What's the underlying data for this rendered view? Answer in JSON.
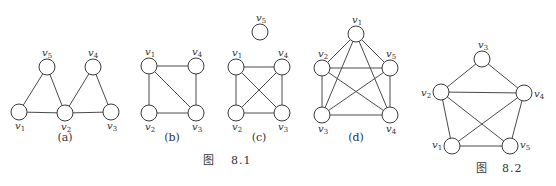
{
  "figures": [
    {
      "id": "8.1a",
      "caption": "(a)",
      "caption_pos": [
        65,
        141
      ],
      "nodes": [
        {
          "name": "v1",
          "x": 19,
          "y": 112,
          "label_dx": -4,
          "label_dy": 17
        },
        {
          "name": "v2",
          "x": 65,
          "y": 113,
          "label_dx": -4,
          "label_dy": 17
        },
        {
          "name": "v3",
          "x": 111,
          "y": 112,
          "label_dx": -4,
          "label_dy": 17
        },
        {
          "name": "v4",
          "x": 93,
          "y": 67,
          "label_dx": -5,
          "label_dy": -11
        },
        {
          "name": "v5",
          "x": 47,
          "y": 67,
          "label_dx": -5,
          "label_dy": -11
        }
      ],
      "edges": [
        [
          "v1",
          "v5"
        ],
        [
          "v5",
          "v2"
        ],
        [
          "v1",
          "v2"
        ],
        [
          "v2",
          "v4"
        ],
        [
          "v4",
          "v3"
        ],
        [
          "v2",
          "v3"
        ]
      ]
    },
    {
      "id": "8.1b",
      "caption": "(b)",
      "caption_pos": [
        172,
        141
      ],
      "nodes": [
        {
          "name": "v1",
          "x": 149,
          "y": 66,
          "label_dx": -4,
          "label_dy": -11
        },
        {
          "name": "v4",
          "x": 196,
          "y": 66,
          "label_dx": -4,
          "label_dy": -11
        },
        {
          "name": "v2",
          "x": 149,
          "y": 113,
          "label_dx": -4,
          "label_dy": 17
        },
        {
          "name": "v3",
          "x": 196,
          "y": 113,
          "label_dx": -4,
          "label_dy": 17
        }
      ],
      "edges": [
        [
          "v1",
          "v4"
        ],
        [
          "v1",
          "v2"
        ],
        [
          "v1",
          "v3"
        ],
        [
          "v4",
          "v3"
        ],
        [
          "v2",
          "v3"
        ]
      ]
    },
    {
      "id": "8.1c",
      "caption": "(c)",
      "caption_pos": [
        259,
        141
      ],
      "nodes": [
        {
          "name": "v5",
          "x": 260,
          "y": 32,
          "label_dx": -4,
          "label_dy": -11
        },
        {
          "name": "v1",
          "x": 236,
          "y": 67,
          "label_dx": -4,
          "label_dy": -11
        },
        {
          "name": "v4",
          "x": 282,
          "y": 67,
          "label_dx": -4,
          "label_dy": -11
        },
        {
          "name": "v2",
          "x": 236,
          "y": 113,
          "label_dx": -4,
          "label_dy": 17
        },
        {
          "name": "v3",
          "x": 282,
          "y": 113,
          "label_dx": -4,
          "label_dy": 17
        }
      ],
      "edges": [
        [
          "v1",
          "v4"
        ],
        [
          "v1",
          "v2"
        ],
        [
          "v1",
          "v3"
        ],
        [
          "v4",
          "v2"
        ],
        [
          "v4",
          "v3"
        ],
        [
          "v2",
          "v3"
        ]
      ]
    },
    {
      "id": "8.1d",
      "caption": "(d)",
      "caption_pos": [
        356,
        141
      ],
      "nodes": [
        {
          "name": "v1",
          "x": 356,
          "y": 34,
          "label_dx": -4,
          "label_dy": -11
        },
        {
          "name": "v2",
          "x": 322,
          "y": 68,
          "label_dx": -4,
          "label_dy": -11
        },
        {
          "name": "v5",
          "x": 390,
          "y": 68,
          "label_dx": -4,
          "label_dy": -11
        },
        {
          "name": "v3",
          "x": 322,
          "y": 115,
          "label_dx": -4,
          "label_dy": 17
        },
        {
          "name": "v4",
          "x": 390,
          "y": 115,
          "label_dx": -4,
          "label_dy": 17
        }
      ],
      "edges": [
        [
          "v1",
          "v2"
        ],
        [
          "v1",
          "v5"
        ],
        [
          "v1",
          "v3"
        ],
        [
          "v1",
          "v4"
        ],
        [
          "v2",
          "v5"
        ],
        [
          "v2",
          "v3"
        ],
        [
          "v2",
          "v4"
        ],
        [
          "v5",
          "v3"
        ],
        [
          "v5",
          "v4"
        ],
        [
          "v3",
          "v4"
        ]
      ]
    },
    {
      "id": "8.2",
      "caption": "",
      "nodes": [
        {
          "name": "v3",
          "x": 482,
          "y": 59,
          "label_dx": -4,
          "label_dy": -11
        },
        {
          "name": "v2",
          "x": 441,
          "y": 92,
          "label_dx": -20,
          "label_dy": 4
        },
        {
          "name": "v4",
          "x": 524,
          "y": 93,
          "label_dx": 10,
          "label_dy": 4
        },
        {
          "name": "v1",
          "x": 452,
          "y": 146,
          "label_dx": -20,
          "label_dy": 2
        },
        {
          "name": "v5",
          "x": 510,
          "y": 146,
          "label_dx": 10,
          "label_dy": 2
        }
      ],
      "edges": [
        [
          "v3",
          "v2"
        ],
        [
          "v3",
          "v4"
        ],
        [
          "v2",
          "v4"
        ],
        [
          "v2",
          "v1"
        ],
        [
          "v2",
          "v5"
        ],
        [
          "v4",
          "v1"
        ],
        [
          "v4",
          "v5"
        ],
        [
          "v1",
          "v5"
        ]
      ]
    }
  ],
  "captions": {
    "fig81": {
      "prefix": "图",
      "number": "8.1",
      "x": 203,
      "y": 164
    },
    "fig82": {
      "prefix": "图",
      "number": "8.2",
      "x": 476,
      "y": 172
    }
  },
  "node_radius": 8
}
